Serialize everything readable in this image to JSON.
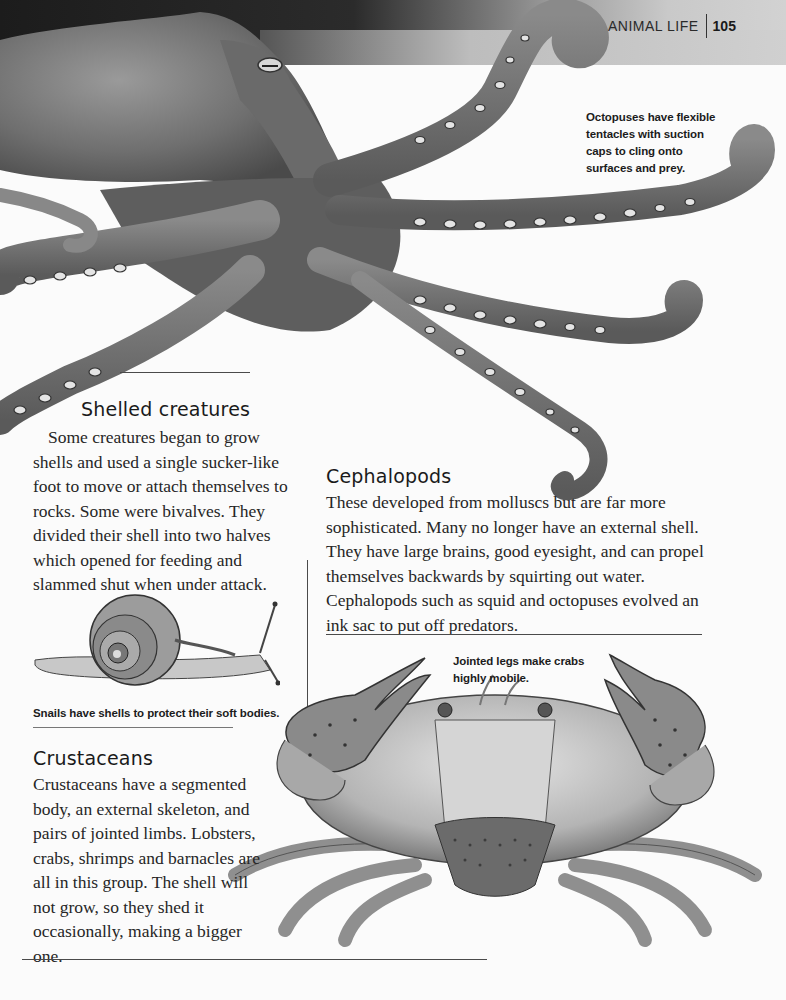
{
  "header": {
    "section_title": "ANIMAL LIFE",
    "page_number": "105"
  },
  "illustrations": {
    "octopus": "octopus-illustration",
    "snail": "snail-illustration",
    "crab": "crab-illustration"
  },
  "captions": {
    "octopus": "Octopuses have flexible tentacles with suction caps to cling onto surfaces and prey.",
    "snail": "Snails have shells to protect their soft bodies.",
    "crab": "Jointed legs make crabs highly mobile."
  },
  "sections": {
    "shelled": {
      "heading": "Shelled creatures",
      "body": "Some creatures began to grow shells and used a single sucker-like foot to move or attach themselves to rocks. Some were bivalves. They divided their shell into two halves which opened for feeding and slammed shut when under attack."
    },
    "cephalopods": {
      "heading": "Cephalopods",
      "body": "These developed from molluscs but are far more sophisticated. Many no longer have an external shell. They have large brains, good eyesight, and can propel themselves backwards by squirting out water. Cephalopods such as squid and octopuses evolved an ink sac to put off predators."
    },
    "crustaceans": {
      "heading": "Crustaceans",
      "body": "Crustaceans have a segmented body, an external skeleton, and pairs of jointed limbs. Lobsters, crabs, shrimps and barnacles are all in this group. The shell will not grow, so they shed it occasionally, making a bigger one."
    }
  }
}
